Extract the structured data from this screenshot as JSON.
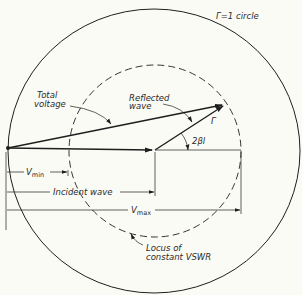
{
  "diagram": {
    "colors": {
      "background": "#fbfbf6",
      "ink": "#1e1e1e"
    },
    "labels": {
      "unit_circle": "Γ=1 circle",
      "total_voltage_1": "Total",
      "total_voltage_2": "voltage",
      "reflected_1": "Reflected",
      "reflected_2": "wave",
      "gamma": "Γ",
      "angle": "2βl",
      "vmin_v": "V",
      "vmin_sub": "min",
      "incident": "Incident wave",
      "vmax_v": "V",
      "vmax_sub": "max",
      "locus_1": "Locus of",
      "locus_2": "constant VSWR"
    }
  }
}
